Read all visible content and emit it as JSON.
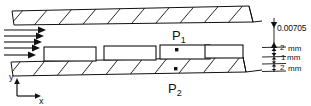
{
  "figure": {
    "type": "engineering-schematic",
    "background_color": "#ffffff",
    "line_color": "#111111",
    "hatch_color": "#111111"
  },
  "inlet": {
    "name": "velocity-profile-arrows",
    "arrow_count": 5,
    "direction": "right"
  },
  "probes": [
    {
      "id": "p1",
      "label": "P",
      "subscript": "1",
      "location": "inside third obstacle"
    },
    {
      "id": "p2",
      "label": "P",
      "subscript": "2",
      "location": "on lower wall centerline"
    }
  ],
  "obstacles": {
    "count": 4,
    "shape": "rectangle"
  },
  "dimensions": [
    {
      "id": "gap",
      "value": "0.00705",
      "unit": ""
    },
    {
      "id": "upper-layer",
      "value": "2",
      "unit": "mm"
    },
    {
      "id": "middle-layer",
      "value": "1",
      "unit": "mm"
    },
    {
      "id": "lower-layer",
      "value": "2",
      "unit": "mm"
    }
  ],
  "axes": {
    "y_label": "y",
    "x_label": "x"
  }
}
